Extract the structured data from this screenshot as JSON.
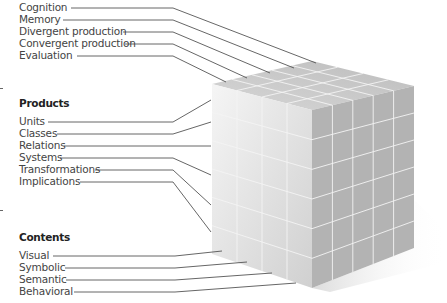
{
  "operations": {
    "items": [
      "Cognition",
      "Memory",
      "Divergent production",
      "Convergent production",
      "Evaluation"
    ]
  },
  "products": {
    "heading": "Products",
    "items": [
      "Units",
      "Classes",
      "Relations",
      "Systems",
      "Transformations",
      "Implications"
    ]
  },
  "contents": {
    "heading": "Contents",
    "items": [
      "Visual",
      "Symbolic",
      "Semantic",
      "Behavioral"
    ]
  },
  "cube": {
    "operations_divisions": 5,
    "products_divisions": 6,
    "contents_divisions": 4
  },
  "colors": {
    "line": "#555555",
    "grid": "#f4f4f4",
    "top_face": "#c9c9c9",
    "right_face": "#b2b2b2",
    "left_face_light": "#f3f3f3",
    "left_face_dark": "#d4d4d4"
  }
}
